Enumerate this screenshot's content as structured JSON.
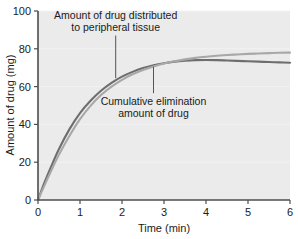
{
  "chart_data": {
    "type": "line",
    "title": "",
    "xlabel": "Time (min)",
    "ylabel": "Amount of drug (mg)",
    "xlim": [
      0,
      6
    ],
    "ylim": [
      0,
      100
    ],
    "xticks": [
      "0",
      "1",
      "2",
      "3",
      "4",
      "5",
      "6"
    ],
    "yticks": [
      "0",
      "20",
      "40",
      "60",
      "80",
      "100"
    ],
    "grid": true,
    "grid_axis": "y",
    "legend": "none",
    "plot_background": "#ebebeb",
    "series": [
      {
        "name": "Amount of drug distributed to peripheral tissue",
        "color": "#6e6e6e",
        "x": [
          0,
          0.15,
          0.3,
          0.5,
          0.75,
          1.0,
          1.25,
          1.5,
          1.75,
          2.0,
          2.25,
          2.5,
          2.75,
          3.0,
          3.25,
          3.5,
          3.75,
          4.0,
          4.25,
          4.5,
          4.75,
          5.0,
          5.25,
          5.5,
          5.75,
          6.0
        ],
        "y": [
          0,
          9.0,
          17.0,
          27.0,
          37.5,
          46.0,
          52.5,
          57.8,
          62.0,
          65.3,
          67.8,
          69.8,
          71.3,
          72.4,
          73.2,
          73.7,
          74.0,
          74.1,
          74.0,
          73.8,
          73.6,
          73.4,
          73.2,
          73.0,
          72.8,
          72.6
        ]
      },
      {
        "name": "Cumulative elimination amount of drug",
        "color": "#a8a8a8",
        "x": [
          0,
          0.15,
          0.3,
          0.5,
          0.75,
          1.0,
          1.25,
          1.5,
          1.75,
          2.0,
          2.25,
          2.5,
          2.75,
          3.0,
          3.25,
          3.5,
          3.75,
          4.0,
          4.25,
          4.5,
          4.75,
          5.0,
          5.25,
          5.5,
          5.75,
          6.0
        ],
        "y": [
          0,
          7.5,
          14.8,
          24.0,
          34.0,
          42.8,
          49.8,
          55.5,
          60.0,
          63.6,
          66.5,
          68.8,
          70.7,
          72.2,
          73.4,
          74.4,
          75.2,
          75.8,
          76.3,
          76.7,
          77.0,
          77.3,
          77.5,
          77.7,
          77.9,
          78.0
        ]
      }
    ],
    "annotations": [
      {
        "id": "annotation-peripheral-tissue",
        "lines": [
          "Amount of drug distributed",
          "to peripheral tissue"
        ],
        "leader_from": [
          1.85,
          87.0
        ],
        "leader_to": [
          1.85,
          64.5
        ]
      },
      {
        "id": "annotation-cumulative-elimination",
        "lines": [
          "Cumulative elimination",
          "amount of drug"
        ],
        "leader_from": [
          2.75,
          56.5
        ],
        "leader_to": [
          2.75,
          70.5
        ]
      }
    ]
  },
  "axes": {
    "x_title": "Time (min)",
    "y_title": "Amount of drug (mg)"
  }
}
